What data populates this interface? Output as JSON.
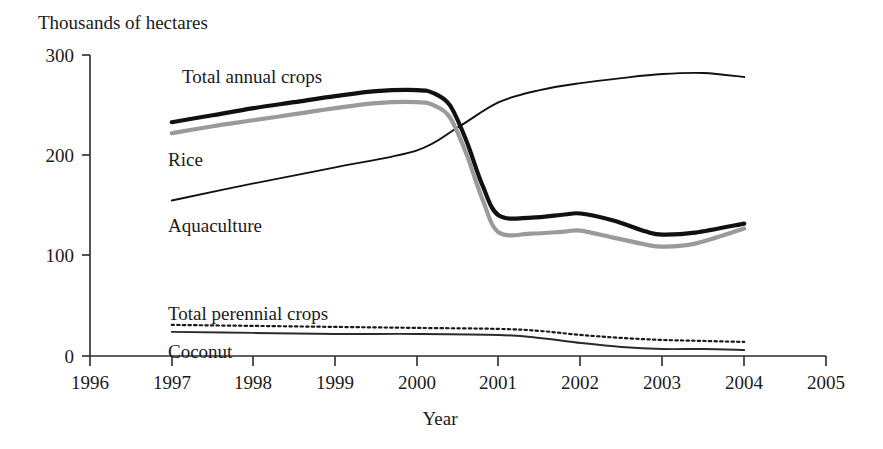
{
  "chart_data": {
    "type": "line",
    "title": "",
    "ylabel": "Thousands of hectares",
    "xlabel": "Year",
    "x": [
      1996,
      1997,
      1998,
      1999,
      2000,
      2001,
      2002,
      2003,
      2004,
      2005
    ],
    "xticklabels": [
      "1996",
      "1997",
      "1998",
      "1999",
      "2000",
      "2001",
      "2002",
      "2003",
      "2004",
      "2005"
    ],
    "yticklabels": [
      "0",
      "100",
      "200",
      "300"
    ],
    "yticks": [
      0,
      100,
      200,
      300
    ],
    "xlim": [
      1996,
      2005
    ],
    "ylim": [
      0,
      300
    ],
    "grid": false,
    "legend_position": "inline-annotations",
    "series": [
      {
        "name": "Total annual crops",
        "color": "#111111",
        "style": "solid-thick",
        "x": [
          1997,
          1997.5,
          1998,
          1998.5,
          1999,
          1999.5,
          2000,
          2000.2,
          2000.4,
          2000.6,
          2000.8,
          2001,
          2001.4,
          2001.8,
          2002,
          2002.4,
          2002.8,
          2003,
          2003.4,
          2004
        ],
        "values": [
          233,
          240,
          247,
          253,
          259,
          264,
          265,
          262,
          250,
          215,
          170,
          140,
          138,
          141,
          142,
          135,
          124,
          121,
          123,
          132
        ]
      },
      {
        "name": "Rice",
        "color": "#9a9a9a",
        "style": "solid-thick",
        "x": [
          1997,
          1997.5,
          1998,
          1998.5,
          1999,
          1999.5,
          2000,
          2000.2,
          2000.4,
          2000.6,
          2000.8,
          2001,
          2001.4,
          2001.8,
          2002,
          2002.4,
          2002.8,
          2003,
          2003.4,
          2004
        ],
        "values": [
          222,
          229,
          235,
          241,
          247,
          252,
          253,
          250,
          238,
          202,
          156,
          123,
          122,
          124,
          125,
          118,
          111,
          109,
          112,
          127
        ]
      },
      {
        "name": "Aquaculture",
        "color": "#111111",
        "style": "solid-thin",
        "x": [
          1997,
          1998,
          1999,
          2000,
          2000.5,
          2001,
          2001.5,
          2002,
          2002.5,
          2003,
          2003.5,
          2004
        ],
        "values": [
          155,
          172,
          188,
          205,
          228,
          253,
          265,
          272,
          277,
          281,
          282,
          278
        ]
      },
      {
        "name": "Total perennial crops",
        "color": "#1a1a1a",
        "style": "dotted",
        "x": [
          1997,
          1998,
          1999,
          2000,
          2001,
          2001.5,
          2002,
          2002.5,
          2003,
          2003.5,
          2004
        ],
        "values": [
          31,
          30,
          29,
          28,
          27,
          25,
          21,
          18,
          16,
          15,
          14
        ]
      },
      {
        "name": "Coconut",
        "color": "#2b2b2b",
        "style": "solid-thin",
        "x": [
          1997,
          1998,
          1999,
          2000,
          2001,
          2001.5,
          2002,
          2002.5,
          2003,
          2003.5,
          2004
        ],
        "values": [
          24,
          23,
          22,
          22,
          21,
          18,
          13,
          9,
          7,
          7,
          6
        ]
      }
    ],
    "annotations": [
      {
        "text": "Total annual crops",
        "x_px": 182,
        "y_px": 83
      },
      {
        "text": "Rice",
        "x_px": 168,
        "y_px": 166
      },
      {
        "text": "Aquaculture",
        "x_px": 168,
        "y_px": 232
      },
      {
        "text": "Total perennial crops",
        "x_px": 168,
        "y_px": 320
      },
      {
        "text": "Coconut",
        "x_px": 168,
        "y_px": 358
      }
    ]
  },
  "labels": {
    "y_axis_title": "Thousands of hectares",
    "x_axis_title": "Year",
    "series_total_annual": "Total annual crops",
    "series_rice": "Rice",
    "series_aquaculture": "Aquaculture",
    "series_total_perennial": "Total perennial crops",
    "series_coconut": "Coconut",
    "ytick_0": "0",
    "ytick_100": "100",
    "ytick_200": "200",
    "ytick_300": "300",
    "xtick_1996": "1996",
    "xtick_1997": "1997",
    "xtick_1998": "1998",
    "xtick_1999": "1999",
    "xtick_2000": "2000",
    "xtick_2001": "2001",
    "xtick_2002": "2002",
    "xtick_2003": "2003",
    "xtick_2004": "2004",
    "xtick_2005": "2005"
  },
  "colors": {
    "total_annual": "#111111",
    "rice": "#9a9a9a",
    "aquaculture": "#111111",
    "perennial": "#1a1a1a",
    "coconut": "#2b2b2b",
    "axis": "#2b2b2b",
    "background": "#ffffff"
  }
}
